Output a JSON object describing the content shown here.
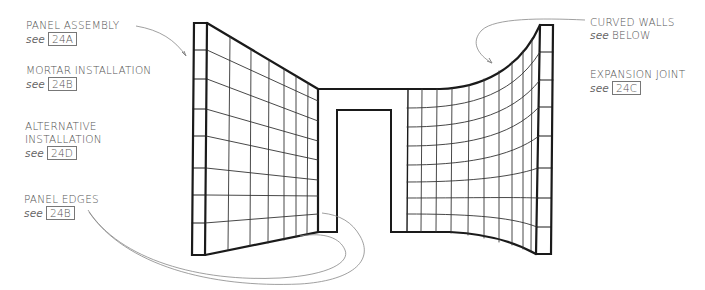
{
  "diagram": {
    "colors": {
      "ink": "#1a1a1a",
      "grid": "#333333",
      "leader": "#888888",
      "text": "#555555"
    }
  },
  "callouts": [
    {
      "id": "panel-assembly",
      "title": "PANEL ASSEMBLY",
      "see": "see",
      "ref": "24A"
    },
    {
      "id": "mortar-installation",
      "title": "MORTAR INSTALLATION",
      "see": "see",
      "ref": "24B"
    },
    {
      "id": "alternative-installation",
      "title_lines": [
        "ALTERNATIVE",
        "INSTALLATION"
      ],
      "see": "see",
      "ref": "24D"
    },
    {
      "id": "panel-edges",
      "title": "PANEL EDGES",
      "see": "see",
      "ref": "24B"
    },
    {
      "id": "curved-walls",
      "title": "CURVED WALLS",
      "see": "see",
      "ref_text": "BELOW"
    },
    {
      "id": "expansion-joint",
      "title": "EXPANSION JOINT",
      "see": "see",
      "ref": "24C"
    }
  ]
}
